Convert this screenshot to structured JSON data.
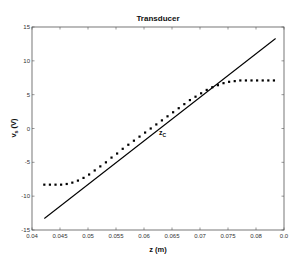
{
  "chart_data": {
    "type": "line",
    "title": "Transducer",
    "xlabel": "z (m)",
    "ylabel_main": "v",
    "ylabel_sub": "s",
    "ylabel_unit": "(V)",
    "xlim": [
      0.04,
      0.085
    ],
    "ylim": [
      -15,
      15
    ],
    "x_ticks": [
      0.04,
      0.045,
      0.05,
      0.055,
      0.06,
      0.065,
      0.07,
      0.075,
      0.08,
      0.085
    ],
    "x_tick_labels": [
      "0.04",
      "0.045",
      "0.05",
      "0.055",
      "0.06",
      "0.065",
      "0.07",
      "0.075",
      "0.08",
      "0.0"
    ],
    "y_ticks": [
      -15,
      -10,
      -5,
      0,
      5,
      10,
      15
    ],
    "y_tick_labels": [
      "-15",
      "-10",
      "-5",
      "0",
      "5",
      "10",
      "15"
    ],
    "grid": false,
    "legend": null,
    "annotations": [
      {
        "text_main": "z",
        "text_sub": "C",
        "x": 0.0627,
        "y": -0.9
      }
    ],
    "series": [
      {
        "name": "linear",
        "style": "solid",
        "color": "#000000",
        "x": [
          0.0422,
          0.0835
        ],
        "y": [
          -13.3,
          13.3
        ]
      },
      {
        "name": "measured",
        "style": "dotted",
        "color": "#000000",
        "x": [
          0.0422,
          0.0432,
          0.0442,
          0.0452,
          0.0462,
          0.0472,
          0.0482,
          0.0492,
          0.0502,
          0.0512,
          0.0522,
          0.0532,
          0.0542,
          0.0552,
          0.0562,
          0.0572,
          0.0582,
          0.0592,
          0.0602,
          0.0612,
          0.0622,
          0.0632,
          0.0642,
          0.0652,
          0.0662,
          0.0672,
          0.0682,
          0.0692,
          0.0702,
          0.0712,
          0.0722,
          0.0732,
          0.0742,
          0.0752,
          0.0762,
          0.0772,
          0.0782,
          0.0792,
          0.0802,
          0.0812,
          0.0822,
          0.0832
        ],
        "y": [
          -8.3,
          -8.3,
          -8.3,
          -8.3,
          -8.2,
          -8.0,
          -7.7,
          -7.3,
          -6.8,
          -6.2,
          -5.6,
          -5.0,
          -4.3,
          -3.7,
          -3.0,
          -2.4,
          -1.8,
          -1.2,
          -0.6,
          0.0,
          0.6,
          1.2,
          1.8,
          2.4,
          3.0,
          3.6,
          4.2,
          4.7,
          5.2,
          5.7,
          6.1,
          6.4,
          6.7,
          6.9,
          7.0,
          7.1,
          7.1,
          7.1,
          7.1,
          7.1,
          7.1,
          7.1
        ]
      }
    ]
  },
  "colors": {
    "axis": "#555555",
    "line": "#000000",
    "background": "#ffffff"
  }
}
